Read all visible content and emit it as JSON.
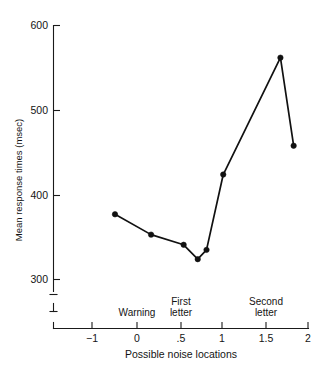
{
  "figure": {
    "cropped_header_text": "",
    "caption": ""
  },
  "chart_data": {
    "type": "line",
    "title": "",
    "xlabel": "Possible noise locations",
    "ylabel": "Mean response times (msec)",
    "xlim": [
      -1.35,
      2.0
    ],
    "ylim": [
      290,
      610
    ],
    "grid": false,
    "legend": "none",
    "y_axis_broken": true,
    "x_ticks": [
      -1,
      0,
      0.5,
      1,
      1.5,
      2
    ],
    "x_tick_labels": [
      "−1",
      "0",
      ".5",
      "1",
      "1.5",
      "2"
    ],
    "y_ticks": [
      300,
      400,
      500,
      600
    ],
    "y_tick_labels": [
      "300",
      "400",
      "500",
      "600"
    ],
    "x": [
      -0.25,
      0.16,
      0.53,
      0.69,
      0.79,
      0.98,
      1.63,
      1.78
    ],
    "values": [
      377,
      353,
      341,
      324,
      335,
      424,
      562,
      458
    ],
    "annotations": [
      {
        "label": "Warning",
        "x": 0.0,
        "lines": [
          "Warning"
        ]
      },
      {
        "label": "First letter",
        "x": 0.5,
        "lines": [
          "First",
          "letter"
        ]
      },
      {
        "label": "Second letter",
        "x": 1.5,
        "lines": [
          "Second",
          "letter"
        ]
      }
    ],
    "marker": "filled-circle",
    "line_color": "#111111",
    "marker_color": "#111111"
  }
}
